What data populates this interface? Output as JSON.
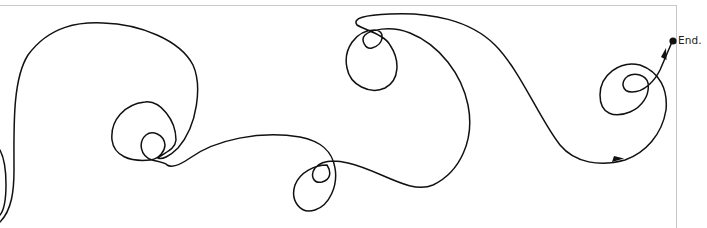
{
  "diagram": {
    "type": "looping-path-illustration",
    "end_label": "End.",
    "stroke_color": "#111111",
    "frame_color": "#c8c8c8",
    "markers": [
      {
        "kind": "arrowhead",
        "location": "lower-right-curve"
      },
      {
        "kind": "arrowhead",
        "location": "final-segment"
      },
      {
        "kind": "end-dot",
        "location": "path-end"
      }
    ]
  }
}
